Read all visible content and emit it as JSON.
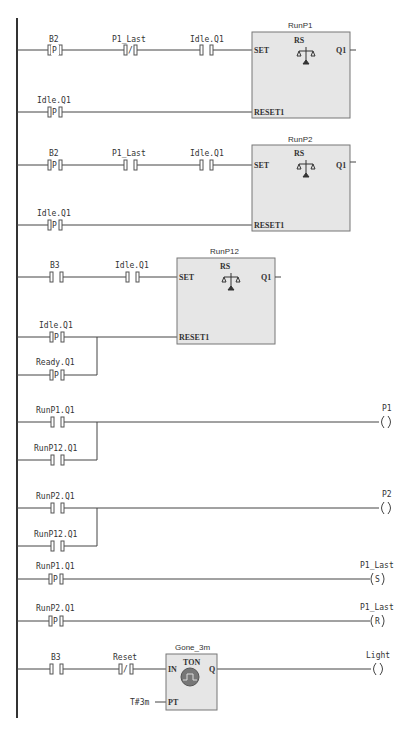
{
  "diagram": {
    "type": "ladder-logic",
    "rungs": [
      {
        "id": 1,
        "contacts": [
          {
            "tag": "B2",
            "type": "P"
          },
          {
            "tag": "P1_Last",
            "type": "NC"
          },
          {
            "tag": "Idle.Q1",
            "type": "NO"
          }
        ],
        "reset_contacts": [
          {
            "tag": "Idle.Q1",
            "type": "P"
          }
        ],
        "block": {
          "instance": "RunP1",
          "type": "RS",
          "inputs": [
            "SET",
            "RESET1"
          ],
          "output": "Q1"
        }
      },
      {
        "id": 2,
        "contacts": [
          {
            "tag": "B2",
            "type": "P"
          },
          {
            "tag": "P1_Last",
            "type": "NO"
          },
          {
            "tag": "Idle.Q1",
            "type": "NO"
          }
        ],
        "reset_contacts": [
          {
            "tag": "Idle.Q1",
            "type": "P"
          }
        ],
        "block": {
          "instance": "RunP2",
          "type": "RS",
          "inputs": [
            "SET",
            "RESET1"
          ],
          "output": "Q1"
        }
      },
      {
        "id": 3,
        "contacts": [
          {
            "tag": "B3",
            "type": "NO"
          },
          {
            "tag": "Idle.Q1",
            "type": "NO"
          }
        ],
        "reset_contacts": [
          {
            "tag": "Idle.Q1",
            "type": "P"
          },
          {
            "tag": "Ready.Q1",
            "type": "P"
          }
        ],
        "block": {
          "instance": "RunP12",
          "type": "RS",
          "inputs": [
            "SET",
            "RESET1"
          ],
          "output": "Q1"
        }
      },
      {
        "id": 4,
        "contacts": [
          {
            "tag": "RunP1.Q1",
            "type": "NO"
          },
          {
            "tag": "RunP12.Q1",
            "type": "NO"
          }
        ],
        "coil": {
          "tag": "P1",
          "type": " "
        }
      },
      {
        "id": 5,
        "contacts": [
          {
            "tag": "RunP2.Q1",
            "type": "NO"
          },
          {
            "tag": "RunP12.Q1",
            "type": "NO"
          }
        ],
        "coil": {
          "tag": "P2",
          "type": " "
        }
      },
      {
        "id": 6,
        "contacts": [
          {
            "tag": "RunP1.Q1",
            "type": "P"
          }
        ],
        "coil": {
          "tag": "P1_Last",
          "type": "S"
        }
      },
      {
        "id": 7,
        "contacts": [
          {
            "tag": "RunP2.Q1",
            "type": "P"
          }
        ],
        "coil": {
          "tag": "P1_Last",
          "type": "R"
        }
      },
      {
        "id": 8,
        "contacts": [
          {
            "tag": "B3",
            "type": "NO"
          },
          {
            "tag": "Reset",
            "type": "NC"
          }
        ],
        "block": {
          "instance": "Gone_3m",
          "type": "TON",
          "inputs": [
            "IN",
            "PT"
          ],
          "output": "Q",
          "pt_value": "T#3m"
        },
        "coil": {
          "tag": "Light",
          "type": " "
        }
      }
    ]
  },
  "text": {
    "r1_c1": "B2",
    "r1_c2": "P1_Last",
    "r1_c3": "Idle.Q1",
    "r1_rst": "Idle.Q1",
    "r1_blk": "RunP1",
    "r1_type": "RS",
    "r1_set": "SET",
    "r1_reset": "RESET1",
    "r1_q": "Q1",
    "r2_c1": "B2",
    "r2_c2": "P1_Last",
    "r2_c3": "Idle.Q1",
    "r2_rst": "Idle.Q1",
    "r2_blk": "RunP2",
    "r2_type": "RS",
    "r2_set": "SET",
    "r2_reset": "RESET1",
    "r2_q": "Q1",
    "r3_c1": "B3",
    "r3_c2": "Idle.Q1",
    "r3_rst1": "Idle.Q1",
    "r3_rst2": "Ready.Q1",
    "r3_blk": "RunP12",
    "r3_type": "RS",
    "r3_set": "SET",
    "r3_reset": "RESET1",
    "r3_q": "Q1",
    "r4_c1": "RunP1.Q1",
    "r4_c2": "RunP12.Q1",
    "r4_coil": "P1",
    "r5_c1": "RunP2.Q1",
    "r5_c2": "RunP12.Q1",
    "r5_coil": "P2",
    "r6_c1": "RunP1.Q1",
    "r6_coil": "P1_Last",
    "r6_coil_type": "S",
    "r7_c1": "RunP2.Q1",
    "r7_coil": "P1_Last",
    "r7_coil_type": "R",
    "r8_c1": "B3",
    "r8_c2": "Reset",
    "r8_blk": "Gone_3m",
    "r8_type": "TON",
    "r8_in": "IN",
    "r8_pt": "PT",
    "r8_q": "Q",
    "r8_ptval": "T#3m",
    "r8_coil": "Light",
    "p": "P",
    "nc": "/"
  }
}
